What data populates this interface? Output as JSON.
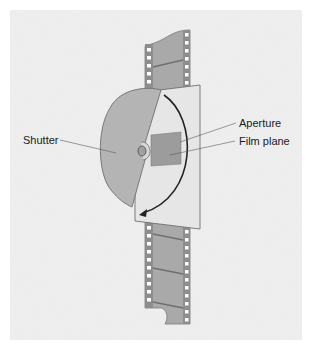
{
  "diagram": {
    "labels": {
      "shutter": "Shutter",
      "aperture": "Aperture",
      "film_plane": "Film plane"
    },
    "colors": {
      "background_texture": "#ececec",
      "film_strip": "#a9a9a9",
      "film_border": "#7a7a7a",
      "sprocket_hole": "#ffffff",
      "gate_plate": "#e6e6e6",
      "shutter_blade": "#b4b4b4",
      "aperture_window": "#9c9c9c",
      "arrow": "#222222",
      "text": "#1a1a1a"
    },
    "rotation_arrow": "clockwise"
  }
}
